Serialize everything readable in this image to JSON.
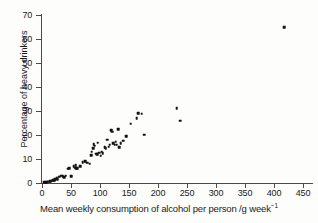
{
  "chart_data": {
    "type": "scatter",
    "title": "",
    "xlabel": "Mean weekly consumption of alcohol per person /g week",
    "xlabel_sup": "−1",
    "ylabel": "Percentage of heavy drinkers",
    "xlim": [
      0,
      470
    ],
    "ylim": [
      0,
      72
    ],
    "xticks": [
      0,
      50,
      100,
      150,
      200,
      250,
      300,
      350,
      400,
      450
    ],
    "yticks": [
      0,
      10,
      20,
      30,
      40,
      50,
      60,
      70
    ],
    "xtick_labels": [
      "0",
      "50",
      "100",
      "150",
      "200",
      "250",
      "300",
      "350",
      "400",
      "450"
    ],
    "ytick_labels": [
      "0",
      "10",
      "20",
      "30",
      "40",
      "50",
      "60",
      "70"
    ],
    "grid": false,
    "legend": null,
    "marker": "square",
    "marker_color": "#111111",
    "points": [
      [
        4,
        0.3
      ],
      [
        7,
        0.4
      ],
      [
        9,
        0.5
      ],
      [
        11,
        0.6
      ],
      [
        13,
        0.8
      ],
      [
        15,
        0.7
      ],
      [
        17,
        1.0
      ],
      [
        19,
        1.2
      ],
      [
        21,
        1.1
      ],
      [
        23,
        1.6
      ],
      [
        25,
        2.0
      ],
      [
        27,
        1.5
      ],
      [
        30,
        2.6
      ],
      [
        33,
        3.0
      ],
      [
        36,
        2.9
      ],
      [
        38,
        2.4
      ],
      [
        41,
        3.0
      ],
      [
        44,
        5.9
      ],
      [
        47,
        6.2
      ],
      [
        50,
        2.9
      ],
      [
        55,
        7.0
      ],
      [
        57,
        6.4
      ],
      [
        58,
        7.4
      ],
      [
        59,
        6.2
      ],
      [
        61,
        6.1
      ],
      [
        66,
        6.9
      ],
      [
        70,
        8.7
      ],
      [
        74,
        9.0
      ],
      [
        78,
        8.5
      ],
      [
        82,
        8.1
      ],
      [
        85,
        11.5
      ],
      [
        86,
        13.0
      ],
      [
        88,
        14.5
      ],
      [
        89,
        16.2
      ],
      [
        91,
        15.5
      ],
      [
        93,
        12.2
      ],
      [
        95,
        11.9
      ],
      [
        96,
        16.8
      ],
      [
        99,
        12.6
      ],
      [
        101,
        11.3
      ],
      [
        103,
        13.0
      ],
      [
        105,
        12.5
      ],
      [
        108,
        15.0
      ],
      [
        110,
        14.4
      ],
      [
        112,
        18.0
      ],
      [
        115,
        15.2
      ],
      [
        117,
        16.0
      ],
      [
        119,
        22.0
      ],
      [
        121,
        21.3
      ],
      [
        123,
        16.5
      ],
      [
        125,
        15.9
      ],
      [
        127,
        17.2
      ],
      [
        129,
        16.0
      ],
      [
        131,
        22.5
      ],
      [
        133,
        14.8
      ],
      [
        136,
        16.5
      ],
      [
        140,
        17.7
      ],
      [
        145,
        19.6
      ],
      [
        153,
        24.7
      ],
      [
        163,
        27.0
      ],
      [
        166,
        29.0
      ],
      [
        172,
        28.8
      ],
      [
        176,
        20.2
      ],
      [
        232,
        31.2
      ],
      [
        238,
        25.9
      ],
      [
        418,
        65.0
      ]
    ]
  }
}
